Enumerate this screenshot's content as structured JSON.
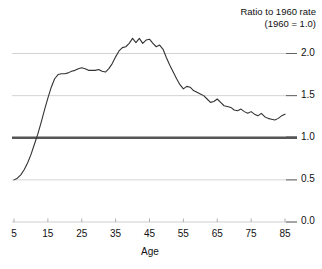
{
  "chart_data": {
    "type": "line",
    "title": "Ratio to 1960 rate",
    "subtitle": "(1960 = 1.0)",
    "xlabel": "Age",
    "ylabel": "",
    "xlim": [
      5,
      85
    ],
    "ylim": [
      0.0,
      2.25
    ],
    "xticks": [
      "5",
      "15",
      "25",
      "35",
      "45",
      "55",
      "65",
      "75",
      "85"
    ],
    "xtick_values": [
      5,
      15,
      25,
      35,
      45,
      55,
      65,
      75,
      85
    ],
    "yticks": [
      "0.0",
      "0.5",
      "1.0",
      "1.5",
      "2.0"
    ],
    "ytick_values": [
      0.0,
      0.5,
      1.0,
      1.5,
      2.0
    ],
    "grid": true,
    "grid_color": "#c8c8c8",
    "reference_line": {
      "value": 1.0,
      "color": "#555555",
      "width": 2.5,
      "label": "1960 = 1.0"
    },
    "line_color": "#333333",
    "line_width": 1.1,
    "legend_position": "none",
    "series": [
      {
        "name": "Ratio to 1960 rate",
        "x": [
          5,
          6,
          7,
          8,
          9,
          10,
          11,
          12,
          13,
          14,
          15,
          16,
          17,
          18,
          19,
          20,
          21,
          22,
          23,
          24,
          25,
          26,
          27,
          28,
          29,
          30,
          31,
          32,
          33,
          34,
          35,
          36,
          37,
          38,
          39,
          40,
          41,
          42,
          43,
          44,
          45,
          46,
          47,
          48,
          49,
          50,
          51,
          52,
          53,
          54,
          55,
          56,
          57,
          58,
          59,
          60,
          61,
          62,
          63,
          64,
          65,
          66,
          67,
          68,
          69,
          70,
          71,
          72,
          73,
          74,
          75,
          76,
          77,
          78,
          79,
          80,
          81,
          82,
          83,
          84,
          85
        ],
        "values": [
          0.5,
          0.52,
          0.56,
          0.62,
          0.7,
          0.8,
          0.92,
          1.04,
          1.18,
          1.33,
          1.47,
          1.6,
          1.7,
          1.75,
          1.76,
          1.76,
          1.77,
          1.79,
          1.8,
          1.82,
          1.83,
          1.82,
          1.8,
          1.8,
          1.8,
          1.81,
          1.79,
          1.78,
          1.82,
          1.88,
          1.96,
          2.03,
          2.07,
          2.08,
          2.12,
          2.18,
          2.13,
          2.18,
          2.12,
          2.16,
          2.17,
          2.12,
          2.08,
          2.1,
          2.05,
          1.95,
          1.86,
          1.78,
          1.7,
          1.63,
          1.58,
          1.61,
          1.6,
          1.56,
          1.54,
          1.52,
          1.5,
          1.46,
          1.42,
          1.43,
          1.46,
          1.42,
          1.38,
          1.37,
          1.36,
          1.33,
          1.32,
          1.34,
          1.31,
          1.29,
          1.31,
          1.28,
          1.26,
          1.29,
          1.25,
          1.23,
          1.22,
          1.21,
          1.23,
          1.26,
          1.28
        ]
      }
    ]
  }
}
